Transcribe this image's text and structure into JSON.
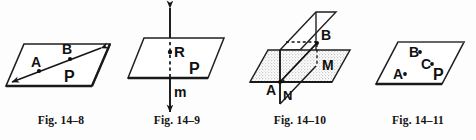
{
  "sheet": {
    "background_color": "#fdfdfd",
    "ink_color": "#141414",
    "fill_color": "#d9d9d9",
    "figure_count": 4
  },
  "figures": [
    {
      "id": "fig-14-8",
      "caption": "Fig. 14–8",
      "description": "Plane P containing a line through points A and B",
      "plane_label": "P",
      "points": [
        {
          "label": "A"
        },
        {
          "label": "B"
        }
      ],
      "lines": [
        {
          "label": "",
          "style": "double-arrow"
        }
      ]
    },
    {
      "id": "fig-14-9",
      "caption": "Fig. 14–9",
      "description": "Line m intersecting plane P at point R",
      "plane_label": "P",
      "points": [
        {
          "label": "R"
        }
      ],
      "lines": [
        {
          "label": "m",
          "style": "double-arrow"
        }
      ]
    },
    {
      "id": "fig-14-10",
      "caption": "Fig. 14–10",
      "description": "Two intersecting planes with points A, B, M, N",
      "plane_label": "",
      "points": [
        {
          "label": "A"
        },
        {
          "label": "B"
        },
        {
          "label": "M"
        },
        {
          "label": "N"
        }
      ],
      "lines": []
    },
    {
      "id": "fig-14-11",
      "caption": "Fig. 14–11",
      "description": "Plane P containing three points A, B and C",
      "plane_label": "P",
      "points": [
        {
          "label": "A"
        },
        {
          "label": "B"
        },
        {
          "label": "C"
        }
      ],
      "lines": []
    }
  ]
}
